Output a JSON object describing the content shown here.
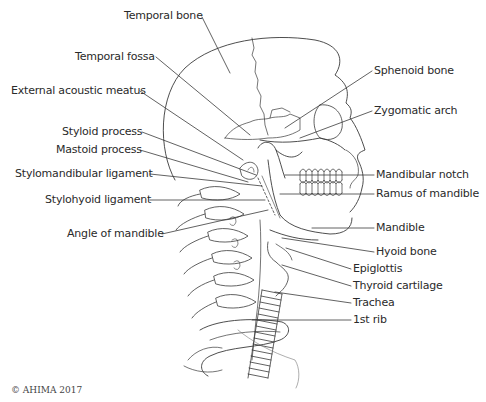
{
  "figure": {
    "copyright": "© AHIMA 2017"
  },
  "labels_left": [
    {
      "text": "Temporal bone",
      "x": 124,
      "y": 9
    },
    {
      "text": "Temporal fossa",
      "x": 75,
      "y": 50
    },
    {
      "text": "External acoustic meatus",
      "x": 11,
      "y": 84
    },
    {
      "text": "Styloid process",
      "x": 62,
      "y": 125
    },
    {
      "text": "Mastoid process",
      "x": 56,
      "y": 143
    },
    {
      "text": "Stylomandibular ligament",
      "x": 15,
      "y": 167
    },
    {
      "text": "Stylohyoid ligament",
      "x": 45,
      "y": 193
    },
    {
      "text": "Angle of mandible",
      "x": 67,
      "y": 227
    }
  ],
  "labels_right": [
    {
      "text": "Sphenoid bone",
      "x": 374,
      "y": 64
    },
    {
      "text": "Zygomatic arch",
      "x": 374,
      "y": 104
    },
    {
      "text": "Mandibular notch",
      "x": 376,
      "y": 168
    },
    {
      "text": "Ramus of mandible",
      "x": 376,
      "y": 187
    },
    {
      "text": "Mandible",
      "x": 376,
      "y": 221
    },
    {
      "text": "Hyoid bone",
      "x": 376,
      "y": 245
    },
    {
      "text": "Epiglottis",
      "x": 353,
      "y": 262
    },
    {
      "text": "Thyroid cartilage",
      "x": 353,
      "y": 279
    },
    {
      "text": "Trachea",
      "x": 353,
      "y": 296
    },
    {
      "text": "1st rib",
      "x": 353,
      "y": 313
    }
  ],
  "colors": {
    "line": "#3a3a3a",
    "text": "#2a2a2a",
    "background": "#ffffff"
  }
}
